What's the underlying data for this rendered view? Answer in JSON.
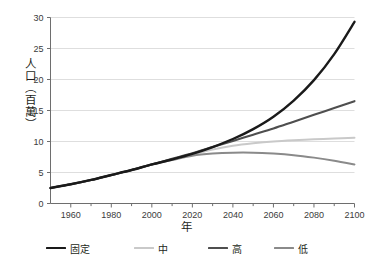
{
  "chart_data": {
    "type": "line",
    "title": "",
    "xlabel": "年",
    "ylabel": "人口（百萬）",
    "xlim": [
      1950,
      2100
    ],
    "ylim": [
      0,
      30
    ],
    "grid": "horizontal",
    "legend_position": "bottom",
    "xticks": [
      1960,
      1980,
      2000,
      2020,
      2040,
      2060,
      2080,
      2100
    ],
    "xticks_labels": [
      "1960",
      "1980",
      "2000",
      "2020",
      "2040",
      "2060",
      "2080",
      "2100"
    ],
    "xminor_step": 10,
    "yticks": [
      0,
      5,
      10,
      15,
      20,
      25,
      30
    ],
    "yticks_labels": [
      "0",
      "5",
      "10",
      "15",
      "20",
      "25",
      "30"
    ],
    "x": [
      1950,
      1960,
      1970,
      1980,
      1990,
      2000,
      2010,
      2020,
      2030,
      2040,
      2050,
      2060,
      2070,
      2080,
      2090,
      2100
    ],
    "series": [
      {
        "name": "固定",
        "color": "#1a1a1a",
        "width": 2.4,
        "values": [
          2.5,
          3.1,
          3.8,
          4.6,
          5.4,
          6.3,
          7.1,
          8.0,
          9.1,
          10.4,
          12.0,
          14.0,
          16.6,
          19.9,
          24.1,
          29.3
        ]
      },
      {
        "name": "中",
        "color": "#c9c9c9",
        "width": 2.0,
        "values": [
          2.5,
          3.1,
          3.8,
          4.6,
          5.4,
          6.3,
          7.1,
          7.9,
          8.7,
          9.3,
          9.7,
          10.0,
          10.2,
          10.35,
          10.5,
          10.6
        ]
      },
      {
        "name": "高",
        "color": "#4f4f4f",
        "width": 2.1,
        "values": [
          2.5,
          3.1,
          3.8,
          4.6,
          5.4,
          6.3,
          7.2,
          8.1,
          9.1,
          10.1,
          11.1,
          12.1,
          13.2,
          14.3,
          15.4,
          16.5
        ]
      },
      {
        "name": "低",
        "color": "#8a8a8a",
        "width": 2.0,
        "values": [
          2.5,
          3.1,
          3.8,
          4.6,
          5.4,
          6.3,
          7.0,
          7.7,
          8.05,
          8.2,
          8.2,
          8.05,
          7.8,
          7.4,
          6.9,
          6.3
        ]
      }
    ],
    "axis_color": "#6e6e6e",
    "grid_color": "#d6d6d6",
    "background": "#ffffff"
  },
  "legend": {
    "items": [
      {
        "label": "固定"
      },
      {
        "label": "中"
      },
      {
        "label": "高"
      },
      {
        "label": "低"
      }
    ]
  }
}
